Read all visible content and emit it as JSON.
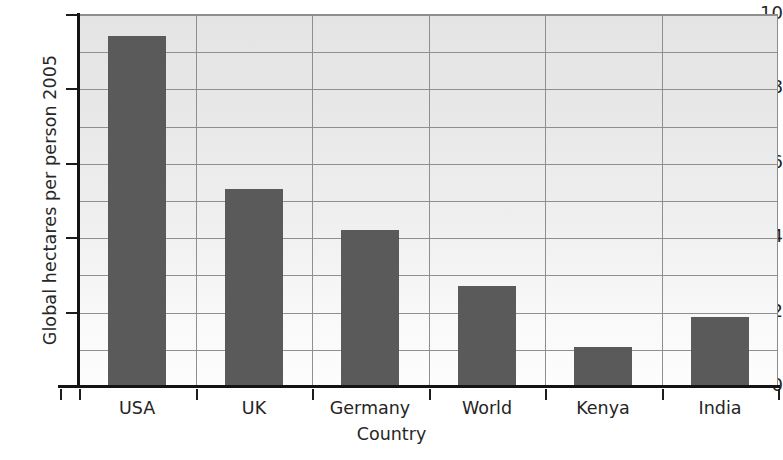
{
  "chart_data": {
    "type": "bar",
    "title": "",
    "xlabel": "Country",
    "ylabel": "Global hectares per person 2005",
    "categories": [
      "USA",
      "UK",
      "Germany",
      "World",
      "Kenya",
      "India"
    ],
    "values": [
      9.4,
      5.3,
      4.2,
      2.7,
      1.05,
      1.85
    ],
    "ylim": [
      0,
      10
    ],
    "ytick_labels": [
      "0",
      "2",
      "4",
      "6",
      "8",
      "10"
    ],
    "ytick_values": [
      0,
      2,
      4,
      6,
      8,
      10
    ],
    "gridlines_y": [
      1,
      2,
      3,
      4,
      5,
      6,
      7,
      8,
      9,
      10
    ],
    "grid": true,
    "legend": "none",
    "bar_color": "#5a5a5a",
    "grid_color": "#8f8f8f",
    "axis_color": "#141414"
  },
  "figure": {
    "background_top": "#e6e6e6",
    "background_bottom": "#ffffff",
    "bleed_text": ""
  }
}
